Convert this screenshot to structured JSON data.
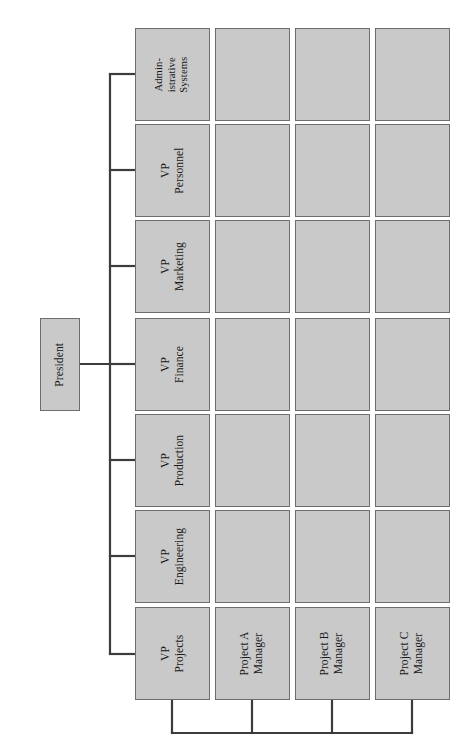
{
  "diagram": {
    "type": "organization-chart",
    "orientation": "rotated-90-counterclockwise",
    "colors": {
      "box_fill": "#c9c9c9",
      "box_border": "#6d6d6d",
      "connector": "#3c3c3c",
      "background": "#ffffff",
      "text": "#171717"
    },
    "root": {
      "label": "President"
    },
    "columns": 4,
    "rows": 7,
    "nodes": [
      {
        "id": "president",
        "label": "President",
        "row": 0,
        "column": 0,
        "empty": false
      },
      {
        "id": "admin-systems",
        "label": "Admin-\nistrative\nSystems",
        "row": 0,
        "column": 1,
        "empty": false
      },
      {
        "id": "admin-systems-c2",
        "label": "",
        "row": 0,
        "column": 2,
        "empty": true
      },
      {
        "id": "admin-systems-c3",
        "label": "",
        "row": 0,
        "column": 3,
        "empty": true
      },
      {
        "id": "admin-systems-c4",
        "label": "",
        "row": 0,
        "column": 4,
        "empty": true
      },
      {
        "id": "vp-personnel",
        "label": "VP\nPersonnel",
        "row": 1,
        "column": 1,
        "empty": false
      },
      {
        "id": "vp-personnel-c2",
        "label": "",
        "row": 1,
        "column": 2,
        "empty": true
      },
      {
        "id": "vp-personnel-c3",
        "label": "",
        "row": 1,
        "column": 3,
        "empty": true
      },
      {
        "id": "vp-personnel-c4",
        "label": "",
        "row": 1,
        "column": 4,
        "empty": true
      },
      {
        "id": "vp-marketing",
        "label": "VP\nMarketing",
        "row": 2,
        "column": 1,
        "empty": false
      },
      {
        "id": "vp-marketing-c2",
        "label": "",
        "row": 2,
        "column": 2,
        "empty": true
      },
      {
        "id": "vp-marketing-c3",
        "label": "",
        "row": 2,
        "column": 3,
        "empty": true
      },
      {
        "id": "vp-marketing-c4",
        "label": "",
        "row": 2,
        "column": 4,
        "empty": true
      },
      {
        "id": "vp-finance",
        "label": "VP\nFinance",
        "row": 3,
        "column": 1,
        "empty": false
      },
      {
        "id": "vp-finance-c2",
        "label": "",
        "row": 3,
        "column": 2,
        "empty": true
      },
      {
        "id": "vp-finance-c3",
        "label": "",
        "row": 3,
        "column": 3,
        "empty": true
      },
      {
        "id": "vp-finance-c4",
        "label": "",
        "row": 3,
        "column": 4,
        "empty": true
      },
      {
        "id": "vp-production",
        "label": "VP\nProduction",
        "row": 4,
        "column": 1,
        "empty": false
      },
      {
        "id": "vp-production-c2",
        "label": "",
        "row": 4,
        "column": 2,
        "empty": true
      },
      {
        "id": "vp-production-c3",
        "label": "",
        "row": 4,
        "column": 3,
        "empty": true
      },
      {
        "id": "vp-production-c4",
        "label": "",
        "row": 4,
        "column": 4,
        "empty": true
      },
      {
        "id": "vp-engineering",
        "label": "VP\nEngineering",
        "row": 5,
        "column": 1,
        "empty": false
      },
      {
        "id": "vp-engineering-c2",
        "label": "",
        "row": 5,
        "column": 2,
        "empty": true
      },
      {
        "id": "vp-engineering-c3",
        "label": "",
        "row": 5,
        "column": 3,
        "empty": true
      },
      {
        "id": "vp-engineering-c4",
        "label": "",
        "row": 5,
        "column": 4,
        "empty": true
      },
      {
        "id": "vp-projects",
        "label": "VP\nProjects",
        "row": 6,
        "column": 1,
        "empty": false
      },
      {
        "id": "project-a-manager",
        "label": "Project A\nManager",
        "row": 6,
        "column": 2,
        "empty": false
      },
      {
        "id": "project-b-manager",
        "label": "Project B\nManager",
        "row": 6,
        "column": 3,
        "empty": false
      },
      {
        "id": "project-c-manager",
        "label": "Project C\nManager",
        "row": 6,
        "column": 4,
        "empty": false
      }
    ],
    "labels": {
      "president": "President",
      "admin_systems": "Admin-\nistrative\nSystems",
      "vp_personnel": "VP\nPersonnel",
      "vp_marketing": "VP\nMarketing",
      "vp_finance": "VP\nFinance",
      "vp_production": "VP\nProduction",
      "vp_engineering": "VP\nEngineering",
      "vp_projects": "VP\nProjects",
      "project_a_manager": "Project A\nManager",
      "project_b_manager": "Project B\nManager",
      "project_c_manager": "Project C\nManager",
      "blank": ""
    }
  }
}
